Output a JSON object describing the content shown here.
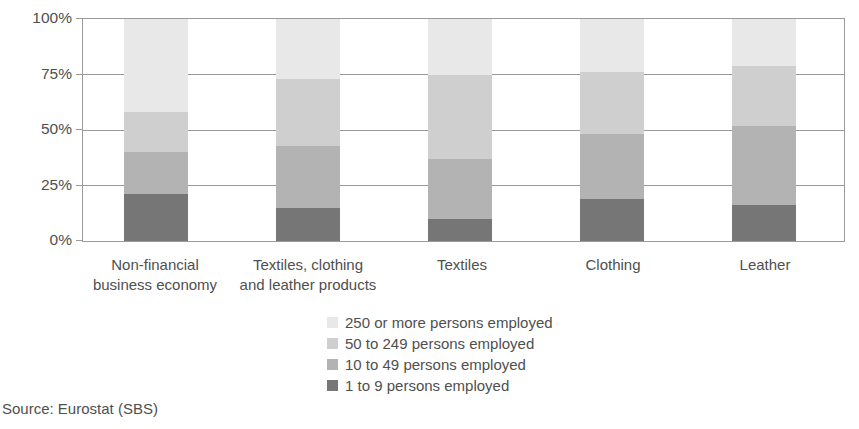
{
  "chart_data": {
    "type": "bar",
    "subtype": "stacked-100-percent",
    "title": "",
    "xlabel": "",
    "ylabel": "",
    "ylim": [
      0,
      100
    ],
    "yticks": [
      "0%",
      "25%",
      "50%",
      "75%",
      "100%"
    ],
    "ytick_values": [
      0,
      25,
      50,
      75,
      100
    ],
    "grid": true,
    "legend_position": "bottom-center",
    "categories": [
      "Non-financial business economy",
      "Textiles, clothing and leather products",
      "Textiles",
      "Clothing",
      "Leather"
    ],
    "category_labels": [
      {
        "line1": "Non-financial",
        "line2": "business economy"
      },
      {
        "line1": "Textiles, clothing",
        "line2": "and leather products"
      },
      {
        "line1": "Textiles",
        "line2": ""
      },
      {
        "line1": "Clothing",
        "line2": ""
      },
      {
        "line1": "Leather",
        "line2": ""
      }
    ],
    "series": [
      {
        "name": "1 to 9 persons employed",
        "color": "#767676",
        "values": [
          21,
          15,
          10,
          19,
          16
        ]
      },
      {
        "name": "10 to 49 persons employed",
        "color": "#b3b3b3",
        "values": [
          19,
          28,
          27,
          29,
          36
        ]
      },
      {
        "name": "50 to 249 persons employed",
        "color": "#cfcfcf",
        "values": [
          18,
          30,
          38,
          28,
          27
        ]
      },
      {
        "name": "250 or more persons employed",
        "color": "#e8e8e8",
        "values": [
          42,
          27,
          25,
          24,
          21
        ]
      }
    ],
    "cumulative_tops": [
      {
        "category": "Non-financial business economy",
        "tops": [
          21,
          40,
          58,
          100
        ]
      },
      {
        "category": "Textiles, clothing and leather products",
        "tops": [
          15,
          43,
          73,
          100
        ]
      },
      {
        "category": "Textiles",
        "tops": [
          10,
          37,
          75,
          100
        ]
      },
      {
        "category": "Clothing",
        "tops": [
          19,
          48,
          76,
          100
        ]
      },
      {
        "category": "Leather",
        "tops": [
          16,
          52,
          79,
          100
        ]
      }
    ]
  },
  "legend": {
    "items": [
      {
        "label": "250 or more persons employed",
        "color": "#e8e8e8"
      },
      {
        "label": "50 to 249 persons employed",
        "color": "#cfcfcf"
      },
      {
        "label": "10 to 49 persons employed",
        "color": "#b3b3b3"
      },
      {
        "label": "1 to 9 persons employed",
        "color": "#767676"
      }
    ]
  },
  "footer": {
    "source": "Source: Eurostat (SBS)"
  },
  "axis": {
    "y_ticks": [
      {
        "label": "100%",
        "value": 100
      },
      {
        "label": "75%",
        "value": 75
      },
      {
        "label": "50%",
        "value": 50
      },
      {
        "label": "25%",
        "value": 25
      },
      {
        "label": "0%",
        "value": 0
      }
    ]
  }
}
